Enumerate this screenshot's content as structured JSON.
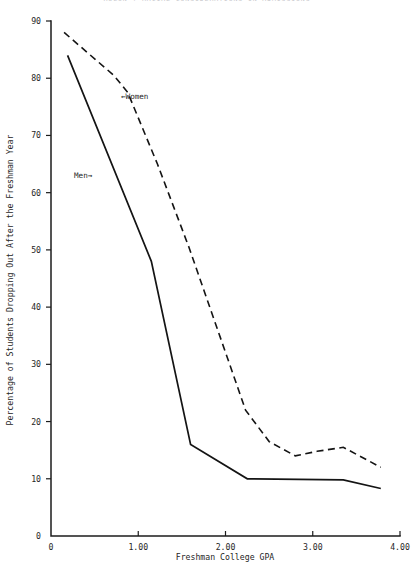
{
  "figure": {
    "clipped_header": "RULON  |  RACIAL  CONSIDERATIONS IN ADMISSIONS"
  },
  "chart_data": {
    "type": "line",
    "title": "",
    "xlabel": "Freshman College GPA",
    "ylabel": "Percentage of Students Dropping Out After the Freshman Year",
    "xlim": [
      0,
      4.0
    ],
    "ylim": [
      0,
      90
    ],
    "xticks": [
      0,
      1.0,
      2.0,
      3.0,
      4.0
    ],
    "xticklabels": [
      "0",
      "1.00",
      "2.00",
      "3.00",
      "4.00"
    ],
    "yticks": [
      0,
      10,
      20,
      30,
      40,
      50,
      60,
      70,
      80,
      90
    ],
    "yticklabels": [
      "0",
      "10",
      "20",
      "30",
      "40",
      "50",
      "60",
      "70",
      "80",
      "90"
    ],
    "grid": false,
    "legend_position": "inline-annotations",
    "series": [
      {
        "name": "Men",
        "style": "solid",
        "annotation": "Men→",
        "x": [
          0.19,
          1.15,
          1.6,
          2.25,
          3.35,
          3.78
        ],
        "y": [
          84.0,
          48.0,
          16.0,
          10.0,
          9.8,
          8.3
        ]
      },
      {
        "name": "Women",
        "style": "dashed",
        "annotation": "←Women",
        "x": [
          0.15,
          0.72,
          0.88,
          1.22,
          1.58,
          2.23,
          2.5,
          2.8,
          3.05,
          3.35,
          3.78
        ],
        "y": [
          88.0,
          80.5,
          77.5,
          65.0,
          50.5,
          22.0,
          16.5,
          14.0,
          14.8,
          15.5,
          12.0
        ]
      }
    ]
  },
  "annotations": {
    "women_label": "←Women",
    "men_label": "Men→"
  }
}
